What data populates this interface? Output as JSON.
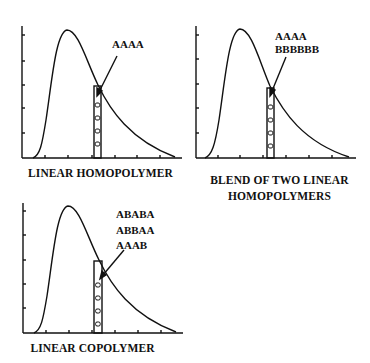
{
  "panels": [
    {
      "id": "linear-homopolymer",
      "caption_lines": [
        "LINEAR HOMOPOLYMER"
      ],
      "annotation_lines": [
        "AAAA"
      ]
    },
    {
      "id": "blend-two-linear-homopolymers",
      "caption_lines": [
        "BLEND OF TWO LINEAR",
        "HOMOPOLYMERS"
      ],
      "annotation_lines": [
        "AAAA",
        "BBBBBB"
      ]
    },
    {
      "id": "linear-copolymer",
      "caption_lines": [
        "LINEAR COPOLYMER"
      ],
      "annotation_lines": [
        "ABABA",
        "ABBAA",
        "AAAB"
      ]
    }
  ],
  "colors": {
    "ink": "#111111",
    "background": "#ffffff"
  }
}
